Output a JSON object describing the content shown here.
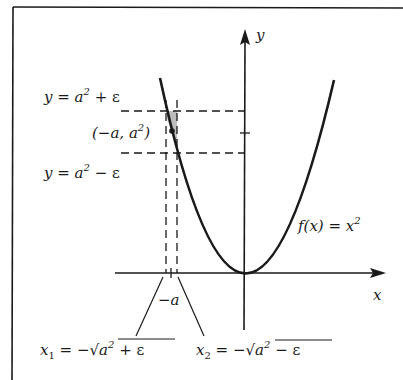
{
  "figure": {
    "axes": {
      "x_label": "x",
      "y_label": "y"
    },
    "curve_label": {
      "lhs": "f(x)",
      "eq": " = ",
      "rhs_base": "x",
      "rhs_exp": "2"
    },
    "upper_line_label": {
      "y": "y",
      "eq": " = ",
      "a": "a",
      "exp": "2",
      "rest": " + ε"
    },
    "lower_line_label": {
      "y": "y",
      "eq": " = ",
      "a": "a",
      "exp": "2",
      "rest": " − ε"
    },
    "point_label": {
      "open": "(−a, a",
      "exp": "2",
      "close": ")"
    },
    "tick_label_neg_a": "−a",
    "x1_label": {
      "name": "x",
      "sub": "1",
      "eq": " = −",
      "radicand_a": "a",
      "exp": "2",
      "radicand_rest": " + ε"
    },
    "x2_label": {
      "name": "x",
      "sub": "2",
      "eq": " = −",
      "radicand_a": "a",
      "exp": "2",
      "radicand_rest": " − ε"
    },
    "colors": {
      "ink": "#1a1a1a",
      "shade": "#bdbdbd",
      "background": "#ffffff"
    }
  }
}
